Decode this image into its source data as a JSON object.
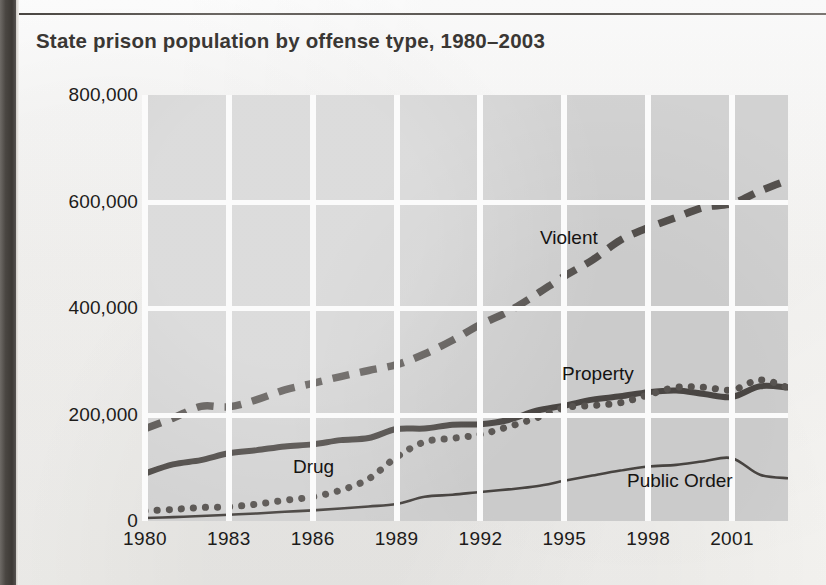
{
  "chart_data": {
    "type": "line",
    "title": "State prison population by offense type, 1980–2003",
    "xlabel": "",
    "ylabel": "",
    "xlim": [
      1980,
      2003
    ],
    "ylim": [
      0,
      800000
    ],
    "grid": true,
    "legend_position": "inline-labels",
    "yticks": [
      "0",
      "200,000",
      "400,000",
      "600,000",
      "800,000"
    ],
    "ytick_values": [
      0,
      200000,
      400000,
      600000,
      800000
    ],
    "xticks": [
      "1980",
      "1983",
      "1986",
      "1989",
      "1992",
      "1995",
      "1998",
      "2001"
    ],
    "xtick_values": [
      1980,
      1983,
      1986,
      1989,
      1992,
      1995,
      1998,
      2001
    ],
    "x": [
      1980,
      1981,
      1982,
      1983,
      1984,
      1985,
      1986,
      1987,
      1988,
      1989,
      1990,
      1991,
      1992,
      1993,
      1994,
      1995,
      1996,
      1997,
      1998,
      1999,
      2000,
      2001,
      2002,
      2003
    ],
    "series": [
      {
        "name": "Violent",
        "style": "dashed",
        "color": "#55514e",
        "values": [
          173300,
          193000,
          215300,
          214400,
          227800,
          246200,
          258600,
          271300,
          282700,
          293600,
          313600,
          339500,
          369100,
          393500,
          425700,
          459600,
          490000,
          527300,
          550800,
          570000,
          589100,
          596100,
          619800,
          640200
        ]
      },
      {
        "name": "Property",
        "style": "solid-thick",
        "color": "#4c4845",
        "values": [
          89300,
          106300,
          114400,
          127100,
          133100,
          140100,
          143900,
          151900,
          155900,
          172700,
          173700,
          180700,
          181600,
          189600,
          207000,
          216600,
          227900,
          234100,
          242000,
          245000,
          238500,
          233000,
          253000,
          250500
        ]
      },
      {
        "name": "Drug",
        "style": "dotted",
        "color": "#5a5653",
        "values": [
          19000,
          21700,
          25300,
          26600,
          31700,
          38900,
          45400,
          57900,
          79100,
          120100,
          148600,
          155200,
          162700,
          177000,
          193500,
          212800,
          216900,
          222100,
          236800,
          251200,
          251100,
          246100,
          265000,
          250400
        ]
      },
      {
        "name": "Public Order",
        "style": "solid-thin",
        "color": "#4a4643",
        "values": [
          5700,
          7200,
          9400,
          11800,
          14200,
          17300,
          20000,
          23400,
          27300,
          31800,
          45500,
          49300,
          54600,
          59400,
          65100,
          75500,
          85300,
          94700,
          102400,
          105400,
          112300,
          118000,
          86700,
          80400
        ]
      }
    ]
  }
}
